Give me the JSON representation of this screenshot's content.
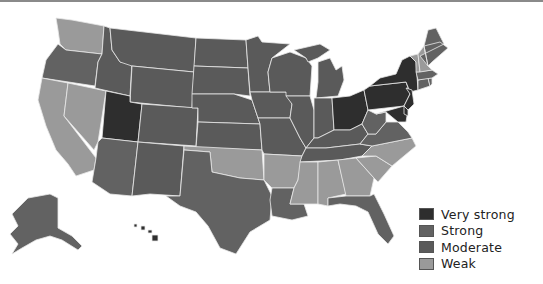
{
  "map": {
    "title": "",
    "colors": {
      "very_strong": "#2e2e2e",
      "strong": "#626262",
      "moderate": "#5a5a5a",
      "weak": "#9a9a9a"
    },
    "states": {
      "WA": "weak",
      "OR": "strong",
      "CA": "weak",
      "NV": "weak",
      "ID": "moderate",
      "MT": "moderate",
      "WY": "moderate",
      "UT": "very_strong",
      "CO": "moderate",
      "AZ": "strong",
      "NM": "moderate",
      "ND": "moderate",
      "SD": "moderate",
      "NE": "moderate",
      "KS": "moderate",
      "OK": "weak",
      "TX": "strong",
      "MN": "moderate",
      "IA": "moderate",
      "MO": "moderate",
      "AR": "weak",
      "LA": "strong",
      "WI": "moderate",
      "IL": "moderate",
      "MI": "moderate",
      "IN": "moderate",
      "OH": "very_strong",
      "KY": "moderate",
      "TN": "moderate",
      "MS": "weak",
      "AL": "weak",
      "GA": "weak",
      "FL": "strong",
      "SC": "weak",
      "NC": "weak",
      "VA": "strong",
      "WV": "strong",
      "PA": "very_strong",
      "NY": "very_strong",
      "NJ": "very_strong",
      "DE": "very_strong",
      "MD": "very_strong",
      "CT": "strong",
      "RI": "strong",
      "MA": "strong",
      "VT": "weak",
      "NH": "weak",
      "ME": "strong",
      "AK": "strong",
      "HI": "very_strong"
    }
  },
  "legend": {
    "items": [
      {
        "key": "very_strong",
        "label": "Very strong"
      },
      {
        "key": "strong",
        "label": "Strong"
      },
      {
        "key": "moderate",
        "label": "Moderate"
      },
      {
        "key": "weak",
        "label": "Weak"
      }
    ]
  },
  "caption": ""
}
